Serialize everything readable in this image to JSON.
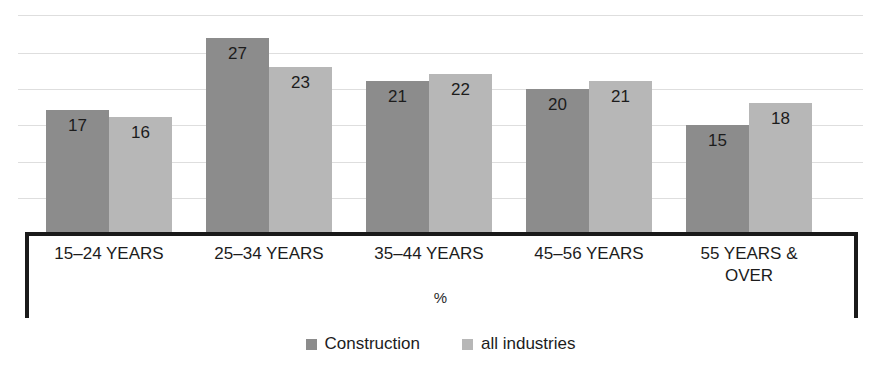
{
  "title_strip": "",
  "chart_data": {
    "type": "bar",
    "title": "",
    "subtitle": "",
    "xlabel": "",
    "ylabel": "%",
    "categories": [
      "15–24 YEARS",
      "25–34 YEARS",
      "35–44 YEARS",
      "45–56 YEARS",
      "55 YEARS &\nOVER"
    ],
    "series": [
      {
        "name": "Construction",
        "color": "#8c8c8c",
        "values": [
          17,
          27,
          21,
          20,
          15
        ]
      },
      {
        "name": "all industries",
        "color": "#b7b7b7",
        "values": [
          16,
          23,
          22,
          21,
          18
        ]
      }
    ],
    "value_labels": true,
    "ylim": [
      0,
      31
    ],
    "gridlines": 6,
    "grid": true,
    "legend_position": "bottom"
  },
  "legend": {
    "items": [
      {
        "label": "Construction",
        "swatch": "dark-gray-swatch"
      },
      {
        "label": "all industries",
        "swatch": "light-gray-swatch"
      }
    ]
  },
  "axis": {
    "unit_label": "%"
  }
}
